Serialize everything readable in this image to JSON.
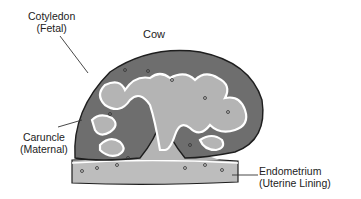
{
  "title": "Cow",
  "labels": {
    "cotyledon": {
      "line1": "Cotyledon",
      "line2": "(Fetal)"
    },
    "caruncle": {
      "line1": "Caruncle",
      "line2": "(Maternal)"
    },
    "endometrium": {
      "line1": "Endometrium",
      "line2": "(Uterine Lining)"
    }
  },
  "colors": {
    "fetal": "#6e6e6e",
    "maternal": "#b4b4b4",
    "endometrium": "#bdbdbd",
    "outline": "#1e1e1e",
    "gap": "#ffffff"
  }
}
